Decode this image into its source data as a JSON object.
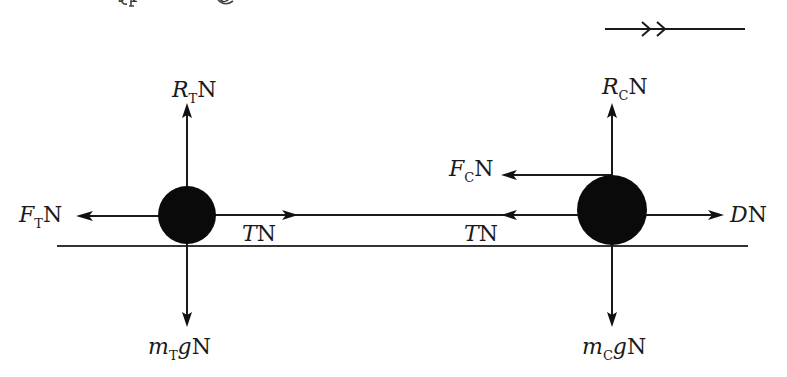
{
  "top_text_cutoff": {
    "visible_fragments": [
      "yp",
      "g"
    ]
  },
  "direction_indicator": {
    "description": "double-chevron direction of motion arrow",
    "direction": "right"
  },
  "ground": {
    "description": "horizontal ground line"
  },
  "bodies": [
    {
      "id": "tractor",
      "subscript": "T",
      "forces": {
        "up": {
          "main": "R",
          "sub": "T",
          "unit": "N"
        },
        "down": {
          "main": "m",
          "sub": "T",
          "tail": "g",
          "unit": "N"
        },
        "left": {
          "main": "F",
          "sub": "T",
          "unit": "N"
        },
        "right": {
          "main": "T",
          "unit": "N"
        }
      }
    },
    {
      "id": "car",
      "subscript": "C",
      "forces": {
        "up": {
          "main": "R",
          "sub": "C",
          "unit": "N"
        },
        "down": {
          "main": "m",
          "sub": "C",
          "tail": "g",
          "unit": "N"
        },
        "left_upper": {
          "main": "F",
          "sub": "C",
          "unit": "N"
        },
        "left": {
          "main": "T",
          "unit": "N"
        },
        "right": {
          "main": "D",
          "unit": "N"
        }
      }
    }
  ],
  "colors": {
    "ink": "#1a1a1a",
    "background": "#ffffff"
  }
}
